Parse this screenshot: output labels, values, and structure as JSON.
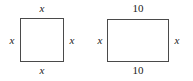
{
  "canvas": {
    "width": 193,
    "height": 81,
    "background_color": "#ffffff",
    "stroke_color": "#4a4a4a",
    "text_color": "#1b1b1b"
  },
  "figures": [
    {
      "name": "square",
      "shape": "square",
      "labels": {
        "top": "x",
        "right": "x",
        "bottom": "x",
        "left": "x"
      }
    },
    {
      "name": "rectangle",
      "shape": "rectangle",
      "labels": {
        "top": "10",
        "right": "x",
        "bottom": "10",
        "left": "x"
      }
    }
  ]
}
